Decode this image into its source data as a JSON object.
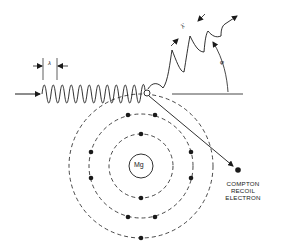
{
  "diagram": {
    "nucleus": {
      "label": "Mg"
    },
    "incident_photon": {
      "wavelength_label": "λ"
    },
    "scattered_photon": {
      "wavelength_label": "λ'",
      "angle_label": "φ"
    },
    "recoil_electron": {
      "label_lines": [
        "COMPTON",
        "RECOIL",
        "ELECTRON"
      ]
    },
    "shells": [
      {
        "name": "K",
        "electrons": 2
      },
      {
        "name": "L",
        "electrons": 8
      },
      {
        "name": "M",
        "electrons": 2
      }
    ],
    "colors": {
      "ink": "#1a1a1a",
      "background": "#ffffff"
    }
  }
}
